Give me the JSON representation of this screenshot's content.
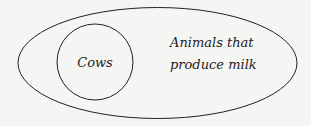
{
  "diagram": {
    "type": "euler",
    "outer_set": {
      "label_line1": "Animals that",
      "label_line2": "produce milk"
    },
    "inner_set": {
      "label": "Cows"
    },
    "stroke_color": "#222222",
    "background": "#f5f5f3"
  }
}
